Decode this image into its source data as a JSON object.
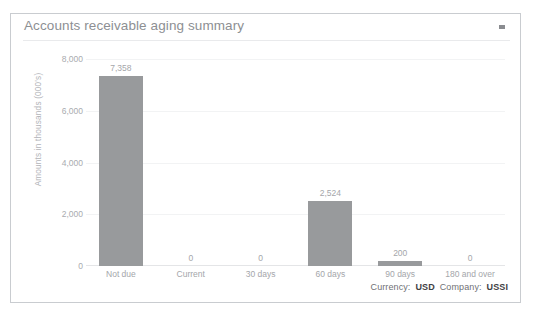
{
  "card": {
    "title": "Accounts receivable aging summary",
    "menu_icon": "chevron-down-icon",
    "border_color": "#c9ccd0"
  },
  "footer": {
    "currency_label": "Currency:",
    "currency_value": "USD",
    "company_label": "Company:",
    "company_value": "USSI"
  },
  "chart_data": {
    "type": "bar",
    "title": "Accounts receivable aging summary",
    "xlabel": "",
    "ylabel": "Amounts in thousands (000's)",
    "categories": [
      "Not due",
      "Current",
      "30 days",
      "60 days",
      "90 days",
      "180 and over"
    ],
    "values": [
      7358,
      0,
      0,
      2524,
      200,
      0
    ],
    "value_labels": [
      "7,358",
      "0",
      "0",
      "2,524",
      "200",
      "0"
    ],
    "ylim": [
      0,
      8000
    ],
    "yticks": [
      0,
      2000,
      4000,
      6000,
      8000
    ],
    "ytick_labels": [
      "0",
      "2,000",
      "4,000",
      "6,000",
      "8,000"
    ],
    "grid": true,
    "legend": false,
    "bar_color": "#989a9c"
  }
}
